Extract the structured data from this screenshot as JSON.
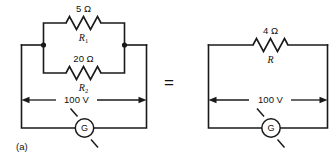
{
  "figure": {
    "caption": "(a)",
    "equals_sign": "=",
    "stroke_color": "#1a1a1a",
    "background_color": "#ffffff"
  },
  "left_circuit": {
    "name": "parallel-resistor-circuit",
    "branches": [
      {
        "id": "branch-top",
        "value_label": "5 Ω",
        "symbol_base": "R",
        "symbol_sub": "1"
      },
      {
        "id": "branch-bottom",
        "value_label": "20 Ω",
        "symbol_base": "R",
        "symbol_sub": "2"
      }
    ],
    "voltage_label": "100 V",
    "meter_label": "G"
  },
  "right_circuit": {
    "name": "equivalent-resistor-circuit",
    "branches": [
      {
        "id": "branch-single",
        "value_label": "4 Ω",
        "symbol_base": "R",
        "symbol_sub": ""
      }
    ],
    "voltage_label": "100 V",
    "meter_label": "G"
  }
}
